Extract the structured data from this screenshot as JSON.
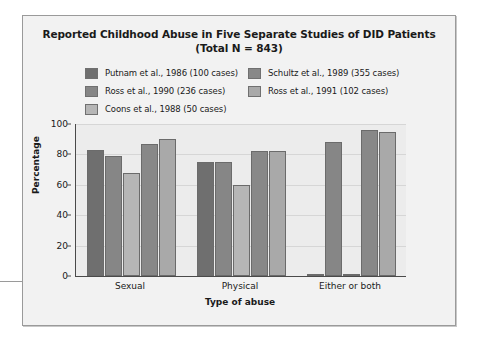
{
  "figure": {
    "title_line1": "Reported Childhood Abuse in Five Separate Studies of DID Patients",
    "title_line2": "(Total N = 843)"
  },
  "chart_data": {
    "type": "bar",
    "title": "Reported Childhood Abuse in Five Separate Studies of DID Patients (Total N = 843)",
    "xlabel": "Type of abuse",
    "ylabel": "Percentage",
    "categories": [
      "Sexual",
      "Physical",
      "Either or both"
    ],
    "ylim": [
      0,
      100
    ],
    "yticks": [
      0,
      20,
      40,
      60,
      80,
      100
    ],
    "grid": "horizontal",
    "legend_position": "top",
    "series": [
      {
        "name": "Putnam et al., 1986 (100 cases)",
        "color": "#6f6f6f",
        "values": [
          83,
          75,
          1
        ]
      },
      {
        "name": "Ross et al., 1990 (236 cases)",
        "color": "#868686",
        "values": [
          79,
          75,
          88
        ]
      },
      {
        "name": "Coons et al., 1988 (50 cases)",
        "color": "#b6b6b6",
        "values": [
          68,
          60,
          1
        ]
      },
      {
        "name": "Schultz et al., 1989 (355 cases)",
        "color": "#888888",
        "values": [
          87,
          82,
          96
        ]
      },
      {
        "name": "Ross et al., 1991 (102 cases)",
        "color": "#a9a9a9",
        "values": [
          90,
          82,
          95
        ]
      }
    ]
  }
}
